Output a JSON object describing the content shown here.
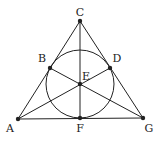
{
  "diagram": {
    "type": "fano-plane",
    "stroke_color": "#222222",
    "background": "#ffffff",
    "points": [
      {
        "id": "A",
        "label": "A",
        "x": 18,
        "y": 119,
        "lx": 10,
        "ly": 132
      },
      {
        "id": "B",
        "label": "B",
        "x": 50,
        "y": 68,
        "lx": 42,
        "ly": 62
      },
      {
        "id": "C",
        "label": "C",
        "x": 80,
        "y": 21,
        "lx": 80,
        "ly": 16
      },
      {
        "id": "D",
        "label": "D",
        "x": 110,
        "y": 68,
        "lx": 117,
        "ly": 62
      },
      {
        "id": "E",
        "label": "E",
        "x": 80,
        "y": 84,
        "lx": 86,
        "ly": 80
      },
      {
        "id": "F",
        "label": "F",
        "x": 80,
        "y": 118,
        "lx": 80,
        "ly": 132
      },
      {
        "id": "G",
        "label": "G",
        "x": 143,
        "y": 118,
        "lx": 149,
        "ly": 132
      }
    ],
    "lines": [
      [
        "A",
        "C"
      ],
      [
        "C",
        "G"
      ],
      [
        "A",
        "G"
      ],
      [
        "C",
        "F"
      ],
      [
        "A",
        "D"
      ],
      [
        "B",
        "G"
      ]
    ],
    "circle": {
      "cx": 80,
      "cy": 84,
      "r": 34,
      "through": [
        "B",
        "D",
        "F"
      ]
    }
  }
}
